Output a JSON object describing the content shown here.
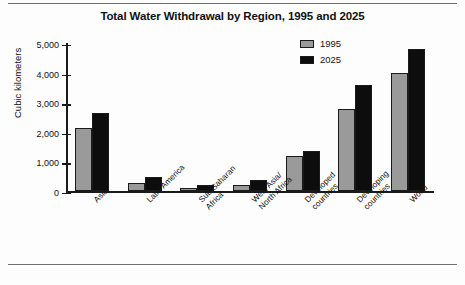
{
  "chart_data": {
    "type": "bar",
    "title": "Total Water Withdrawal by Region, 1995 and 2025",
    "xlabel": "",
    "ylabel": "Cubic kilometers",
    "ylim": [
      0,
      5000
    ],
    "yticks": [
      0,
      1000,
      2000,
      3000,
      4000,
      5000
    ],
    "ytick_labels": [
      "0",
      "1,000",
      "2,000",
      "3,000",
      "4,000",
      "5,000"
    ],
    "grid": false,
    "legend_position": "top-right",
    "categories": [
      "Asia",
      "Latin America",
      "Sub-Saharan\nAfrica",
      "West Asia/\nNorth Africa",
      "Developed\ncountries",
      "Developing\ncountries",
      "World"
    ],
    "series": [
      {
        "name": "1995",
        "color": "#9a9a9a",
        "values": [
          2150,
          300,
          130,
          230,
          1200,
          2800,
          4000
        ]
      },
      {
        "name": "2025",
        "color": "#0d0d0d",
        "values": [
          2650,
          500,
          230,
          400,
          1350,
          3600,
          4800
        ]
      }
    ]
  },
  "legend": {
    "items": [
      {
        "label": "1995"
      },
      {
        "label": "2025"
      }
    ]
  }
}
